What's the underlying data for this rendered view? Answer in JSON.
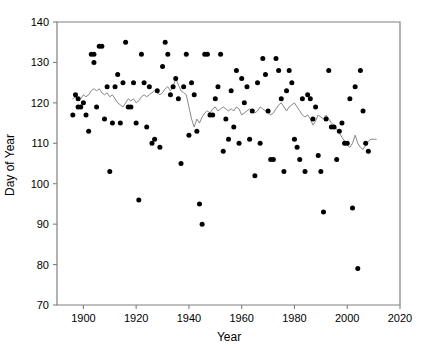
{
  "chart_data": {
    "type": "scatter",
    "title": "",
    "subtitle": "",
    "xlabel": "Year",
    "ylabel": "Day of Year",
    "xlim": [
      1890,
      2020
    ],
    "ylim": [
      70,
      140
    ],
    "xticks": [
      1900,
      1920,
      1940,
      1960,
      1980,
      2000,
      2020
    ],
    "yticks": [
      70,
      80,
      90,
      100,
      110,
      120,
      130,
      140
    ],
    "grid": false,
    "legend": null,
    "legend_position": "none",
    "marker_color": "#000000",
    "line_color": "#7a7a7a",
    "axis_color": "#808080",
    "series": [
      {
        "name": "Day of Year observations",
        "type": "scatter",
        "points": [
          [
            1896,
            117
          ],
          [
            1897,
            122
          ],
          [
            1898,
            121
          ],
          [
            1898,
            119
          ],
          [
            1899,
            119
          ],
          [
            1900,
            120
          ],
          [
            1901,
            117
          ],
          [
            1902,
            113
          ],
          [
            1903,
            132
          ],
          [
            1904,
            132
          ],
          [
            1904,
            130
          ],
          [
            1905,
            119
          ],
          [
            1906,
            134
          ],
          [
            1907,
            134
          ],
          [
            1908,
            116
          ],
          [
            1909,
            124
          ],
          [
            1910,
            103
          ],
          [
            1911,
            115
          ],
          [
            1912,
            124
          ],
          [
            1913,
            127
          ],
          [
            1914,
            115
          ],
          [
            1915,
            125
          ],
          [
            1916,
            135
          ],
          [
            1917,
            119
          ],
          [
            1918,
            119
          ],
          [
            1919,
            125
          ],
          [
            1920,
            115
          ],
          [
            1921,
            96
          ],
          [
            1922,
            132
          ],
          [
            1923,
            125
          ],
          [
            1924,
            114
          ],
          [
            1925,
            124
          ],
          [
            1926,
            110
          ],
          [
            1927,
            111
          ],
          [
            1928,
            123
          ],
          [
            1929,
            109
          ],
          [
            1930,
            129
          ],
          [
            1931,
            135
          ],
          [
            1932,
            132
          ],
          [
            1933,
            122
          ],
          [
            1934,
            124
          ],
          [
            1935,
            126
          ],
          [
            1936,
            121
          ],
          [
            1937,
            105
          ],
          [
            1938,
            124
          ],
          [
            1939,
            132
          ],
          [
            1940,
            112
          ],
          [
            1941,
            125
          ],
          [
            1942,
            122
          ],
          [
            1943,
            113
          ],
          [
            1944,
            95
          ],
          [
            1945,
            90
          ],
          [
            1946,
            132
          ],
          [
            1947,
            132
          ],
          [
            1948,
            117
          ],
          [
            1949,
            117
          ],
          [
            1950,
            121
          ],
          [
            1951,
            124
          ],
          [
            1952,
            132
          ],
          [
            1953,
            108
          ],
          [
            1954,
            116
          ],
          [
            1955,
            111
          ],
          [
            1956,
            123
          ],
          [
            1957,
            114
          ],
          [
            1958,
            128
          ],
          [
            1959,
            110
          ],
          [
            1960,
            126
          ],
          [
            1961,
            120
          ],
          [
            1962,
            124
          ],
          [
            1963,
            111
          ],
          [
            1964,
            118
          ],
          [
            1965,
            102
          ],
          [
            1966,
            125
          ],
          [
            1967,
            110
          ],
          [
            1968,
            131
          ],
          [
            1969,
            127
          ],
          [
            1970,
            118
          ],
          [
            1971,
            106
          ],
          [
            1972,
            106
          ],
          [
            1973,
            131
          ],
          [
            1974,
            128
          ],
          [
            1975,
            121
          ],
          [
            1976,
            103
          ],
          [
            1977,
            123
          ],
          [
            1978,
            128
          ],
          [
            1979,
            125
          ],
          [
            1980,
            111
          ],
          [
            1981,
            109
          ],
          [
            1982,
            106
          ],
          [
            1983,
            121
          ],
          [
            1984,
            103
          ],
          [
            1985,
            122
          ],
          [
            1986,
            121
          ],
          [
            1987,
            116
          ],
          [
            1988,
            119
          ],
          [
            1989,
            107
          ],
          [
            1990,
            103
          ],
          [
            1991,
            93
          ],
          [
            1992,
            116
          ],
          [
            1993,
            128
          ],
          [
            1994,
            114
          ],
          [
            1995,
            114
          ],
          [
            1996,
            106
          ],
          [
            1997,
            113
          ],
          [
            1998,
            115
          ],
          [
            1999,
            110
          ],
          [
            2000,
            110
          ],
          [
            2001,
            121
          ],
          [
            2002,
            94
          ],
          [
            2003,
            124
          ],
          [
            2004,
            79
          ],
          [
            2005,
            128
          ],
          [
            2006,
            118
          ],
          [
            2007,
            110
          ],
          [
            2008,
            108
          ]
        ]
      },
      {
        "name": "Smoothed trend (running mean)",
        "type": "line",
        "points": [
          [
            1896,
            121
          ],
          [
            1897,
            121.5
          ],
          [
            1898,
            120.5
          ],
          [
            1899,
            121
          ],
          [
            1900,
            122
          ],
          [
            1901,
            121.5
          ],
          [
            1902,
            122
          ],
          [
            1903,
            123
          ],
          [
            1904,
            123.5
          ],
          [
            1905,
            123
          ],
          [
            1906,
            123.5
          ],
          [
            1907,
            122.5
          ],
          [
            1908,
            122
          ],
          [
            1909,
            122.5
          ],
          [
            1910,
            121.5
          ],
          [
            1911,
            122
          ],
          [
            1912,
            121
          ],
          [
            1913,
            120
          ],
          [
            1914,
            119.5
          ],
          [
            1915,
            119
          ],
          [
            1916,
            120
          ],
          [
            1917,
            121
          ],
          [
            1918,
            120.5
          ],
          [
            1919,
            121
          ],
          [
            1920,
            120
          ],
          [
            1921,
            120.5
          ],
          [
            1922,
            121.5
          ],
          [
            1923,
            122
          ],
          [
            1924,
            121.5
          ],
          [
            1925,
            122
          ],
          [
            1926,
            122.5
          ],
          [
            1927,
            123
          ],
          [
            1928,
            122.5
          ],
          [
            1929,
            122
          ],
          [
            1930,
            122.5
          ],
          [
            1931,
            123.5
          ],
          [
            1932,
            124
          ],
          [
            1933,
            123
          ],
          [
            1934,
            124
          ],
          [
            1935,
            126
          ],
          [
            1936,
            124.5
          ],
          [
            1937,
            123
          ],
          [
            1938,
            122.5
          ],
          [
            1939,
            122
          ],
          [
            1940,
            119
          ],
          [
            1941,
            116
          ],
          [
            1942,
            114
          ],
          [
            1943,
            116
          ],
          [
            1944,
            115
          ],
          [
            1945,
            116.5
          ],
          [
            1946,
            117.5
          ],
          [
            1947,
            118
          ],
          [
            1948,
            117.5
          ],
          [
            1949,
            118.5
          ],
          [
            1950,
            119
          ],
          [
            1951,
            118
          ],
          [
            1952,
            118.5
          ],
          [
            1953,
            119
          ],
          [
            1954,
            118.5
          ],
          [
            1955,
            118
          ],
          [
            1956,
            118.5
          ],
          [
            1957,
            118
          ],
          [
            1958,
            119
          ],
          [
            1959,
            118.5
          ],
          [
            1960,
            117
          ],
          [
            1961,
            117.5
          ],
          [
            1962,
            118
          ],
          [
            1963,
            118.5
          ],
          [
            1964,
            118
          ],
          [
            1965,
            117.5
          ],
          [
            1966,
            118
          ],
          [
            1967,
            119
          ],
          [
            1968,
            118.5
          ],
          [
            1969,
            118
          ],
          [
            1970,
            117.5
          ],
          [
            1971,
            117
          ],
          [
            1972,
            117.5
          ],
          [
            1973,
            118.5
          ],
          [
            1974,
            119.5
          ],
          [
            1975,
            120
          ],
          [
            1976,
            119
          ],
          [
            1977,
            118
          ],
          [
            1978,
            119
          ],
          [
            1979,
            119.5
          ],
          [
            1980,
            120
          ],
          [
            1981,
            119
          ],
          [
            1982,
            118
          ],
          [
            1983,
            117
          ],
          [
            1984,
            116.5
          ],
          [
            1985,
            117
          ],
          [
            1986,
            116
          ],
          [
            1987,
            114.5
          ],
          [
            1988,
            115.5
          ],
          [
            1989,
            117
          ],
          [
            1990,
            116.5
          ],
          [
            1991,
            116
          ],
          [
            1992,
            117
          ],
          [
            1993,
            116
          ],
          [
            1994,
            115
          ],
          [
            1995,
            114.5
          ],
          [
            1996,
            113.5
          ],
          [
            1997,
            112.5
          ],
          [
            1998,
            111.5
          ],
          [
            1999,
            110.5
          ],
          [
            2000,
            109.5
          ],
          [
            2001,
            109
          ],
          [
            2002,
            110
          ],
          [
            2003,
            112
          ],
          [
            2004,
            110
          ],
          [
            2005,
            109
          ],
          [
            2006,
            108.5
          ],
          [
            2007,
            109.5
          ],
          [
            2008,
            110.5
          ],
          [
            2009,
            111
          ],
          [
            2010,
            111
          ],
          [
            2011,
            111
          ]
        ]
      }
    ]
  }
}
